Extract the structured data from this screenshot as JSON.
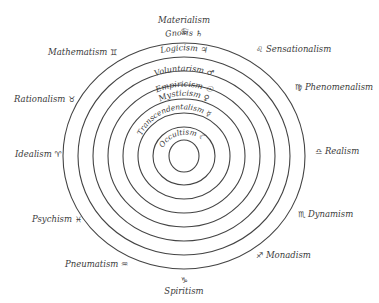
{
  "diagram": {
    "center": {
      "x": 184,
      "y": 156
    },
    "rings": [
      {
        "rx": 121,
        "ry": 113
      },
      {
        "rx": 106,
        "ry": 99
      },
      {
        "rx": 91,
        "ry": 85
      },
      {
        "rx": 76,
        "ry": 71
      },
      {
        "rx": 61,
        "ry": 57
      },
      {
        "rx": 46,
        "ry": 43
      },
      {
        "rx": 31,
        "ry": 29
      },
      {
        "rx": 15,
        "ry": 16
      }
    ],
    "ring_labels": [
      {
        "text": "Gnosis",
        "symbol": "♄"
      },
      {
        "text": "Logicism",
        "symbol": "♃"
      },
      {
        "text": "Voluntarism",
        "symbol": "♂"
      },
      {
        "text": "Empiricism",
        "symbol": "☉"
      },
      {
        "text": "Mysticism",
        "symbol": "♀"
      },
      {
        "text": "Transcendentalism",
        "symbol": "☿"
      },
      {
        "text": "Occultism",
        "symbol": "☾"
      }
    ],
    "outer_labels": [
      {
        "text": "Materialism",
        "symbol": "♋"
      },
      {
        "text": "Sensationalism",
        "symbol": "♌"
      },
      {
        "text": "Phenomenalism",
        "symbol": "♍"
      },
      {
        "text": "Realism",
        "symbol": "♎"
      },
      {
        "text": "Dynamism",
        "symbol": "♏"
      },
      {
        "text": "Monadism",
        "symbol": "♐"
      },
      {
        "text": "Spiritism",
        "symbol": "♑"
      },
      {
        "text": "Pneumatism",
        "symbol": "♒"
      },
      {
        "text": "Psychism",
        "symbol": "♓"
      },
      {
        "text": "Idealism",
        "symbol": "♈"
      },
      {
        "text": "Rationalism",
        "symbol": "♉"
      },
      {
        "text": "Mathematism",
        "symbol": "♊"
      }
    ]
  }
}
